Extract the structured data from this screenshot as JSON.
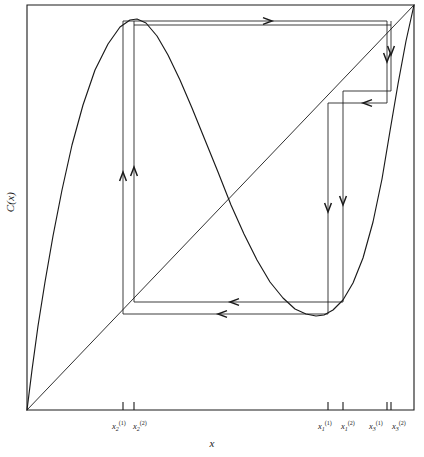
{
  "figure": {
    "name": "cobweb-iteration-diagram",
    "background_color": "#ffffff",
    "ink_color": "#1a1a1a"
  },
  "axes": {
    "x_title": "x",
    "y_title": "C(x)",
    "frame": {
      "left": 27,
      "top": 5,
      "right": 414,
      "bottom": 410
    },
    "x_range": [
      0,
      1
    ],
    "y_range": [
      0,
      1
    ],
    "grid": false,
    "legend": "none"
  },
  "tick_labels": [
    {
      "id": "tick-x2-1",
      "base": "x",
      "sub": "2",
      "sup": "(1)",
      "x_px": 112,
      "y_px": 420
    },
    {
      "id": "tick-x2-2",
      "base": "x",
      "sub": "2",
      "sup": "(2)",
      "x_px": 133,
      "y_px": 420
    },
    {
      "id": "tick-x1-1",
      "base": "x",
      "sub": "1",
      "sup": "(1)",
      "x_px": 318,
      "y_px": 420
    },
    {
      "id": "tick-x1-2",
      "base": "x",
      "sub": "1",
      "sup": "(2)",
      "x_px": 341,
      "y_px": 420
    },
    {
      "id": "tick-x3-1",
      "base": "x",
      "sub": "3",
      "sup": "(1)",
      "x_px": 369,
      "y_px": 420
    },
    {
      "id": "tick-x3-2",
      "base": "x",
      "sub": "3",
      "sup": "(2)",
      "x_px": 392,
      "y_px": 420
    }
  ],
  "ticks": [
    {
      "id": "tick-mark-x2-1",
      "x_px": 123
    },
    {
      "id": "tick-mark-x2-2",
      "x_px": 134
    },
    {
      "id": "tick-mark-x1-1",
      "x_px": 328
    },
    {
      "id": "tick-mark-x1-2",
      "x_px": 343
    },
    {
      "id": "tick-mark-x3-1",
      "x_px": 387
    },
    {
      "id": "tick-mark-x3-2",
      "x_px": 391
    }
  ],
  "chart_data": {
    "type": "line",
    "title": "",
    "subtitle": "",
    "xlabel": "x",
    "ylabel": "C(x)",
    "xlim": [
      0,
      1
    ],
    "ylim": [
      0,
      1
    ],
    "grid": false,
    "legend_position": "none",
    "series": [
      {
        "name": "C(x)",
        "role": "map-curve",
        "description": "Unimodal-cubic map curve rising steeply from origin to a maximum near x=0.28, falling to a minimum near x=0.76, then rising to the top-right corner.",
        "points_px": [
          [
            27,
            410
          ],
          [
            32,
            370
          ],
          [
            38,
            326
          ],
          [
            45,
            282
          ],
          [
            53,
            236
          ],
          [
            62,
            190
          ],
          [
            72,
            145
          ],
          [
            83,
            105
          ],
          [
            95,
            70
          ],
          [
            108,
            44
          ],
          [
            120,
            27
          ],
          [
            130,
            20
          ],
          [
            137,
            19
          ],
          [
            146,
            23
          ],
          [
            157,
            36
          ],
          [
            168,
            55
          ],
          [
            180,
            80
          ],
          [
            192,
            108
          ],
          [
            205,
            140
          ],
          [
            218,
            172
          ],
          [
            231,
            205
          ],
          [
            244,
            234
          ],
          [
            257,
            260
          ],
          [
            270,
            282
          ],
          [
            283,
            298
          ],
          [
            295,
            309
          ],
          [
            306,
            314
          ],
          [
            316,
            316
          ],
          [
            324,
            315
          ],
          [
            333,
            310
          ],
          [
            343,
            300
          ],
          [
            353,
            283
          ],
          [
            363,
            258
          ],
          [
            373,
            222
          ],
          [
            382,
            179
          ],
          [
            390,
            131
          ],
          [
            398,
            84
          ],
          [
            406,
            41
          ],
          [
            414,
            5
          ]
        ]
      },
      {
        "name": "y = x",
        "role": "identity-diagonal",
        "points_px": [
          [
            27,
            410
          ],
          [
            414,
            5
          ]
        ]
      }
    ],
    "cobweb": {
      "description": "Period-3 cobweb orbit: vertical and horizontal staircase segments linking the curve to the diagonal, with direction arrows.",
      "vertical_segments": [
        {
          "id": "v-left-inner",
          "x_px": 123,
          "y1_px": 314,
          "y2_px": 21
        },
        {
          "id": "v-left-outer",
          "x_px": 134,
          "y1_px": 302,
          "y2_px": 21
        },
        {
          "id": "v-right-inner",
          "x_px": 328,
          "y1_px": 103,
          "y2_px": 314
        },
        {
          "id": "v-right-outer",
          "x_px": 343,
          "y1_px": 91,
          "y2_px": 302
        },
        {
          "id": "v-far-right-inner",
          "x_px": 387,
          "y1_px": 21,
          "y2_px": 103
        },
        {
          "id": "v-far-right-outer",
          "x_px": 391,
          "y1_px": 21,
          "y2_px": 91
        }
      ],
      "horizontal_segments": [
        {
          "id": "h-top-inner",
          "y_px": 21,
          "x1_px": 123,
          "x2_px": 387
        },
        {
          "id": "h-top-outer",
          "y_px": 25,
          "x1_px": 134,
          "x2_px": 391
        },
        {
          "id": "h-mid-inner",
          "y_px": 91,
          "x1_px": 343,
          "x2_px": 391
        },
        {
          "id": "h-mid-outer",
          "y_px": 103,
          "x1_px": 328,
          "x2_px": 387
        },
        {
          "id": "h-bottom-inner",
          "y_px": 302,
          "x1_px": 134,
          "x2_px": 343
        },
        {
          "id": "h-bottom-outer",
          "y_px": 314,
          "x1_px": 123,
          "x2_px": 328
        }
      ],
      "arrows": [
        {
          "id": "arrow-up-inner",
          "x_px": 123,
          "y_px": 172,
          "direction": "up"
        },
        {
          "id": "arrow-up-outer",
          "x_px": 134,
          "y_px": 167,
          "direction": "up"
        },
        {
          "id": "arrow-right-top",
          "x_px": 272,
          "y_px": 21,
          "direction": "right"
        },
        {
          "id": "arrow-down-far-right-inner",
          "x_px": 387,
          "y_px": 62,
          "direction": "down"
        },
        {
          "id": "arrow-down-far-right-outer",
          "x_px": 391,
          "y_px": 55,
          "direction": "down"
        },
        {
          "id": "arrow-left-mid",
          "x_px": 363,
          "y_px": 103,
          "direction": "left"
        },
        {
          "id": "arrow-down-right-inner",
          "x_px": 328,
          "y_px": 212,
          "direction": "down"
        },
        {
          "id": "arrow-down-right-outer",
          "x_px": 343,
          "y_px": 205,
          "direction": "down"
        },
        {
          "id": "arrow-left-bottom-inner",
          "x_px": 230,
          "y_px": 302,
          "direction": "left"
        },
        {
          "id": "arrow-left-bottom-outer",
          "x_px": 218,
          "y_px": 314,
          "direction": "left"
        }
      ]
    }
  }
}
